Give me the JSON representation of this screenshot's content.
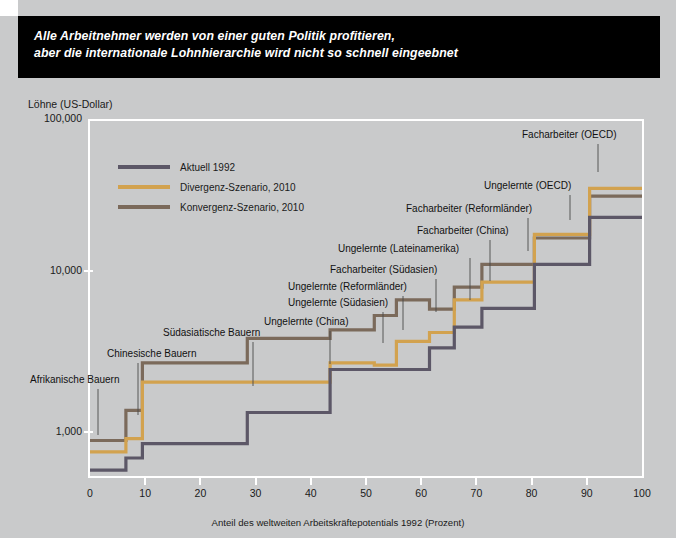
{
  "banner": {
    "line1": "Alle Arbeitnehmer werden von einer guten Politik profitieren,",
    "line2": "aber die internationale Lohnhierarchie wird nicht so schnell eingeebnet"
  },
  "axis": {
    "y_title": "Löhne (US-Dollar)",
    "x_caption": "Anteil des weltweiten Arbeitskräftepotentials 1992 (Prozent)",
    "y_ticks": [
      "100,000",
      "10,000",
      "1,000"
    ],
    "x_ticks": [
      "0",
      "10",
      "20",
      "30",
      "40",
      "50",
      "60",
      "70",
      "80",
      "90",
      "100"
    ]
  },
  "legend": {
    "items": [
      {
        "label": "Aktuell 1992",
        "color": "#5c5767"
      },
      {
        "label": "Divergenz-Szenario, 2010",
        "color": "#d2a24f"
      },
      {
        "label": "Konvergenz-Szenario, 2010",
        "color": "#7b6a5b"
      }
    ]
  },
  "annotations": [
    {
      "text": "Afrikanische Bauern",
      "x": 30,
      "y": 374,
      "lx": 98,
      "ly": 389,
      "ly2": 435
    },
    {
      "text": "Chinesische Bauern",
      "x": 107,
      "y": 348,
      "lx": 138,
      "ly": 363,
      "ly2": 415
    },
    {
      "text": "Südasiatische Bauern",
      "x": 163,
      "y": 327,
      "lx": 253,
      "ly": 342,
      "ly2": 386
    },
    {
      "text": "Ungelernte (China)",
      "x": 264,
      "y": 316,
      "lx": 330,
      "ly": 331,
      "ly2": 364
    },
    {
      "text": "Ungelernte (Südasien)",
      "x": 288,
      "y": 297,
      "lx": 383,
      "ly": 312,
      "ly2": 343
    },
    {
      "text": "Ungelernte (Reformländer)",
      "x": 288,
      "y": 281,
      "lx": 403,
      "ly": 296,
      "ly2": 330
    },
    {
      "text": "Facharbeiter (Südasien)",
      "x": 330,
      "y": 264,
      "lx": 436,
      "ly": 279,
      "ly2": 312
    },
    {
      "text": "Ungelernte (Lateinamerika)",
      "x": 338,
      "y": 243,
      "lx": 470,
      "ly": 258,
      "ly2": 300
    },
    {
      "text": "Facharbeiter (China)",
      "x": 417,
      "y": 225,
      "lx": 490,
      "ly": 240,
      "ly2": 281
    },
    {
      "text": "Facharbeiter (Reformländer)",
      "x": 406,
      "y": 203,
      "lx": 528,
      "ly": 218,
      "ly2": 251
    },
    {
      "text": "Ungelernte (OECD)",
      "x": 484,
      "y": 180,
      "lx": 570,
      "ly": 195,
      "ly2": 220
    },
    {
      "text": "Facharbeiter (OECD)",
      "x": 522,
      "y": 129,
      "lx": 598,
      "ly": 144,
      "ly2": 172
    }
  ],
  "chart_data": {
    "type": "line",
    "title": "Alle Arbeitnehmer werden von einer guten Politik profitieren, aber die internationale Lohnhierarchie wird nicht so schnell eingeebnet",
    "xlabel": "Anteil des weltweiten Arbeitskräftepotentials 1992 (Prozent)",
    "ylabel": "Löhne (US-Dollar)",
    "xlim": [
      0,
      100
    ],
    "ylim": [
      700,
      100000
    ],
    "yscale": "log",
    "grid": false,
    "legend_position": "top-left-inside",
    "step_style": "post",
    "segments": [
      {
        "group": "Afrikanische Bauern",
        "x_from": 0,
        "x_to": 6.5
      },
      {
        "group": "Chinesische Bauern",
        "x_from": 6.5,
        "x_to": 9.5
      },
      {
        "group": "Südasiatische Bauern",
        "x_from": 9.5,
        "x_to": 28.5
      },
      {
        "group": "Ungelernte (China)",
        "x_from": 28.5,
        "x_to": 43.5
      },
      {
        "group": "Ungelernte (Südasien)",
        "x_from": 43.5,
        "x_to": 51.5
      },
      {
        "group": "Ungelernte (Reformländer)",
        "x_from": 51.5,
        "x_to": 55.5
      },
      {
        "group": "Facharbeiter (Südasien)",
        "x_from": 55.5,
        "x_to": 61.5
      },
      {
        "group": "Ungelernte (Lateinamerika)",
        "x_from": 61.5,
        "x_to": 66.0
      },
      {
        "group": "Facharbeiter (China)",
        "x_from": 66.0,
        "x_to": 71.0
      },
      {
        "group": "Facharbeiter (Reformländer)",
        "x_from": 71.0,
        "x_to": 80.5
      },
      {
        "group": "Ungelernte (OECD)",
        "x_from": 80.5,
        "x_to": 90.5
      },
      {
        "group": "Facharbeiter (OECD)",
        "x_from": 90.5,
        "x_to": 100
      }
    ],
    "series": [
      {
        "name": "Aktuell 1992",
        "color": "#5c5767",
        "values": [
          760,
          900,
          1100,
          1700,
          3100,
          3100,
          3100,
          4200,
          5600,
          7300,
          13500,
          26000
        ]
      },
      {
        "name": "Divergenz-Szenario, 2010",
        "color": "#d2a24f",
        "values": [
          980,
          1180,
          2600,
          2600,
          3400,
          3300,
          4600,
          5200,
          8200,
          10500,
          20500,
          39000
        ]
      },
      {
        "name": "Konvergenz-Szenario, 2010",
        "color": "#7b6a5b",
        "values": [
          1150,
          1750,
          3400,
          4800,
          5400,
          6600,
          8200,
          7200,
          9800,
          13500,
          19500,
          35000
        ]
      }
    ]
  }
}
